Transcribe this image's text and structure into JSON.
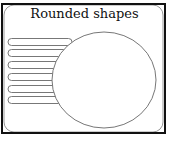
{
  "title": "Rounded shapes",
  "colors": {
    "frame": "#111111",
    "stroke": "#777777",
    "fill": "#ffffff"
  },
  "pills": [
    42,
    53,
    65,
    77,
    89,
    100
  ]
}
